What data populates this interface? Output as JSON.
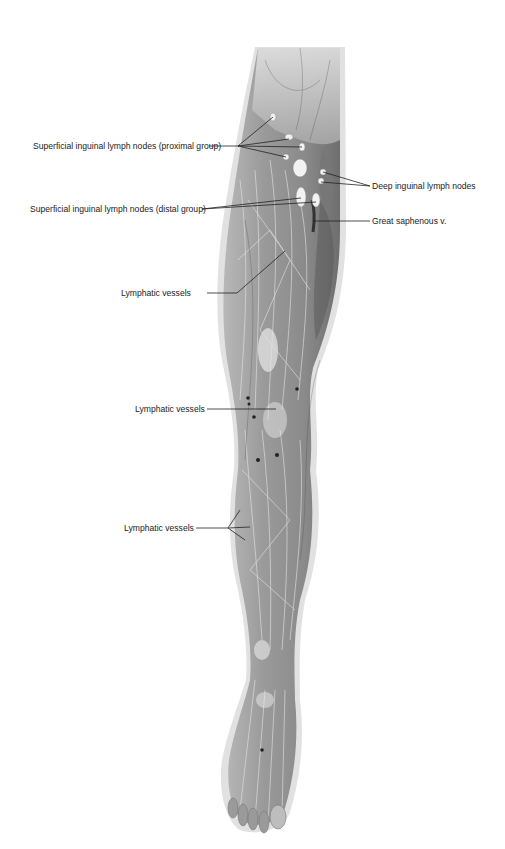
{
  "figure": {
    "labels": [
      {
        "id": "superficial-inguinal-proximal",
        "text": "Superficial inguinal lymph nodes (proximal group)",
        "side": "left"
      },
      {
        "id": "deep-inguinal",
        "text": "Deep inguinal lymph nodes",
        "side": "right"
      },
      {
        "id": "superficial-inguinal-distal",
        "text": "Superficial inguinal lymph nodes (distal group)",
        "side": "left"
      },
      {
        "id": "great-saphenous-v",
        "text": "Great saphenous v.",
        "side": "right"
      },
      {
        "id": "lymphatic-vessels-thigh",
        "text": "Lymphatic vessels",
        "side": "left"
      },
      {
        "id": "lymphatic-vessels-knee",
        "text": "Lymphatic vessels",
        "side": "left"
      },
      {
        "id": "lymphatic-vessels-leg",
        "text": "Lymphatic vessels",
        "side": "left"
      }
    ]
  }
}
